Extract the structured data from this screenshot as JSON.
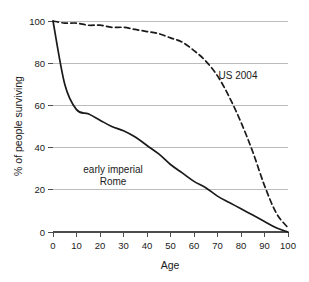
{
  "chart_data": {
    "type": "line",
    "title": "",
    "xlabel": "Age",
    "ylabel": "% of people surviving",
    "xlim": [
      0,
      100
    ],
    "ylim": [
      0,
      100
    ],
    "xticks": [
      0,
      10,
      20,
      30,
      40,
      50,
      60,
      70,
      80,
      90,
      100
    ],
    "yticks": [
      0,
      20,
      40,
      60,
      80,
      100
    ],
    "xtick_labels": [
      "0",
      "10",
      "20",
      "30",
      "40",
      "50",
      "60",
      "70",
      "80",
      "90",
      "100"
    ],
    "ytick_labels": [
      "0",
      "20",
      "40",
      "60",
      "80",
      "100"
    ],
    "grid": "horizontal",
    "legend_position": "inline-annotations",
    "colors": {
      "curve": "#1a1a1a",
      "gridline": "#b5b5b5",
      "axis": "#4d4d4d",
      "background": "#ffffff"
    },
    "x": [
      0,
      5,
      10,
      15,
      20,
      25,
      30,
      35,
      40,
      45,
      50,
      55,
      60,
      65,
      70,
      75,
      80,
      85,
      90,
      95,
      100
    ],
    "series": [
      {
        "name": "early imperial Rome",
        "style": "solid",
        "label_lines": [
          "early imperial",
          "Rome"
        ],
        "label_x": 27,
        "label_y": 30,
        "values": [
          100,
          70,
          58,
          56,
          53,
          50,
          48,
          45,
          41,
          37,
          32,
          28,
          24,
          21,
          17,
          14,
          11,
          8,
          5,
          2,
          0
        ]
      },
      {
        "name": "US 2004",
        "style": "dashed",
        "label_lines": [
          "US 2004"
        ],
        "label_x": 73,
        "label_y": 72,
        "values": [
          100,
          99,
          99,
          98,
          98,
          97,
          97,
          96,
          95,
          94,
          92,
          90,
          86,
          81,
          74,
          64,
          52,
          38,
          22,
          9,
          2
        ]
      }
    ]
  }
}
